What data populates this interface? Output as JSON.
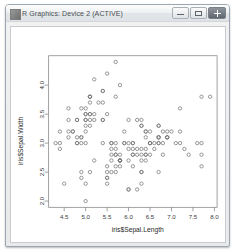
{
  "window": {
    "title": "R Graphics: Device 2 (ACTIVE)",
    "icon": "r-graphics-icon",
    "controls": {
      "minimize": "Minimize",
      "maximize": "Maximize",
      "close": "Close"
    }
  },
  "chart_data": {
    "type": "scatter",
    "title": "",
    "xlabel": "iris$Sepal.Length",
    "ylabel": "iris$Sepal.Width",
    "xlim": [
      4.3,
      7.9
    ],
    "ylim": [
      2.0,
      4.4
    ],
    "xticks": [
      "4.5",
      "5.0",
      "5.5",
      "6.0",
      "6.5",
      "7.0",
      "7.5",
      "8.0"
    ],
    "xtick_values": [
      4.5,
      5.0,
      5.5,
      6.0,
      6.5,
      7.0,
      7.5,
      8.0
    ],
    "yticks": [
      "2.0",
      "2.5",
      "3.0",
      "3.5",
      "4.0"
    ],
    "ytick_values": [
      2.0,
      2.5,
      3.0,
      3.5,
      4.0
    ],
    "grid": false,
    "legend": null,
    "marker": "open-circle",
    "marker_color": "#767676",
    "x": [
      5.1,
      4.9,
      4.7,
      4.6,
      5.0,
      5.4,
      4.6,
      5.0,
      4.4,
      4.9,
      5.4,
      4.8,
      4.8,
      4.3,
      5.8,
      5.7,
      5.4,
      5.1,
      5.7,
      5.1,
      5.4,
      5.1,
      4.6,
      5.1,
      4.8,
      5.0,
      5.0,
      5.2,
      5.2,
      4.7,
      4.8,
      5.4,
      5.2,
      5.5,
      4.9,
      5.0,
      5.5,
      4.9,
      4.4,
      5.1,
      5.0,
      4.5,
      4.4,
      5.0,
      5.1,
      4.8,
      5.1,
      4.6,
      5.3,
      5.0,
      7.0,
      6.4,
      6.9,
      5.5,
      6.5,
      5.7,
      6.3,
      4.9,
      6.6,
      5.2,
      5.0,
      5.9,
      6.0,
      6.1,
      5.6,
      6.7,
      5.6,
      5.8,
      6.2,
      5.6,
      5.9,
      6.1,
      6.3,
      6.1,
      6.4,
      6.6,
      6.8,
      6.7,
      6.0,
      5.7,
      5.5,
      5.5,
      5.8,
      6.0,
      5.4,
      6.0,
      6.7,
      6.3,
      5.6,
      5.5,
      5.5,
      6.1,
      5.8,
      5.0,
      5.6,
      5.7,
      5.7,
      6.2,
      5.1,
      5.7,
      6.3,
      5.8,
      7.1,
      6.3,
      6.5,
      7.6,
      4.9,
      7.3,
      6.7,
      7.2,
      6.5,
      6.4,
      6.8,
      5.7,
      5.8,
      6.4,
      6.5,
      7.7,
      7.7,
      6.0,
      6.9,
      5.6,
      7.7,
      6.3,
      6.7,
      7.2,
      6.2,
      6.1,
      6.4,
      7.2,
      7.4,
      7.9,
      6.4,
      6.3,
      6.1,
      7.7,
      6.3,
      6.4,
      6.0,
      6.9,
      6.7,
      6.9,
      5.8,
      6.8,
      6.7,
      6.7,
      6.3,
      6.5,
      6.2,
      5.9
    ],
    "y": [
      3.5,
      3.0,
      3.2,
      3.1,
      3.6,
      3.9,
      3.4,
      3.4,
      2.9,
      3.1,
      3.7,
      3.4,
      3.0,
      3.0,
      4.0,
      4.4,
      3.9,
      3.5,
      3.8,
      3.8,
      3.4,
      3.7,
      3.6,
      3.3,
      3.4,
      3.0,
      3.4,
      3.5,
      3.4,
      3.2,
      3.1,
      3.4,
      4.1,
      4.2,
      3.1,
      3.2,
      3.5,
      3.6,
      3.0,
      3.4,
      3.5,
      2.3,
      3.2,
      3.5,
      3.8,
      3.0,
      3.8,
      3.2,
      3.7,
      3.3,
      3.2,
      3.2,
      3.1,
      2.3,
      2.8,
      2.8,
      3.3,
      2.4,
      2.9,
      2.7,
      2.0,
      3.0,
      2.2,
      2.9,
      2.9,
      3.1,
      3.0,
      2.7,
      2.2,
      2.5,
      3.2,
      2.8,
      2.5,
      2.8,
      2.9,
      3.0,
      2.8,
      3.0,
      2.9,
      2.6,
      2.4,
      2.4,
      2.7,
      2.7,
      3.0,
      3.4,
      3.1,
      2.3,
      3.0,
      2.5,
      2.6,
      3.0,
      2.6,
      2.3,
      2.7,
      3.0,
      2.9,
      2.9,
      2.5,
      2.8,
      3.3,
      2.7,
      3.0,
      2.9,
      3.0,
      3.0,
      2.5,
      2.9,
      2.5,
      3.6,
      3.2,
      2.7,
      3.0,
      2.5,
      2.8,
      3.2,
      3.0,
      3.8,
      2.6,
      2.2,
      3.2,
      2.8,
      2.8,
      2.7,
      3.3,
      3.2,
      2.8,
      3.0,
      2.8,
      3.0,
      2.8,
      3.8,
      2.8,
      2.8,
      2.6,
      3.0,
      3.4,
      3.1,
      3.0,
      3.1,
      3.1,
      3.1,
      2.7,
      3.2,
      3.3,
      3.0,
      2.5,
      3.0,
      3.4,
      3.0
    ]
  }
}
